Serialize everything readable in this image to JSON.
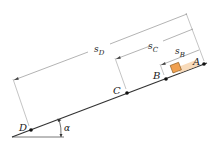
{
  "diagram": {
    "points": [
      {
        "id": "A",
        "label": "A"
      },
      {
        "id": "B",
        "label": "B"
      },
      {
        "id": "C",
        "label": "C"
      },
      {
        "id": "D",
        "label": "D"
      }
    ],
    "dimensions": [
      {
        "id": "sB",
        "base": "s",
        "sub": "B",
        "from": "A",
        "to": "B"
      },
      {
        "id": "sC",
        "base": "s",
        "sub": "C",
        "from": "A",
        "to": "C"
      },
      {
        "id": "sD",
        "base": "s",
        "sub": "D",
        "from": "A",
        "to": "D"
      }
    ],
    "angle_label": "α",
    "colors": {
      "line": "#333333",
      "dim_line": "#777777",
      "block_fill": "#f0a050",
      "block_stroke": "#8a5a20",
      "block_shadow": "#f6d2aa",
      "point": "#111111"
    }
  }
}
